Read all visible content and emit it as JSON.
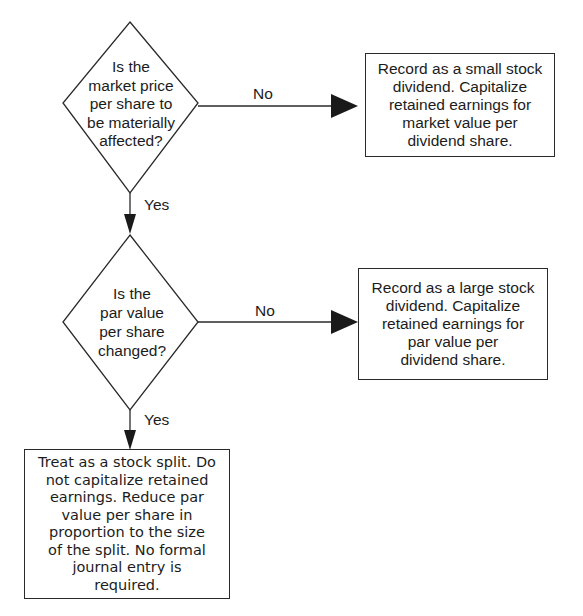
{
  "decisions": [
    {
      "id": "market-price",
      "lines": [
        "Is the",
        "market price",
        "per share to",
        "be materially",
        "affected?"
      ]
    },
    {
      "id": "par-value",
      "lines": [
        "Is the",
        "par value",
        "per share",
        "changed?"
      ]
    }
  ],
  "outcomes": [
    {
      "id": "small-stock-dividend",
      "lines": [
        "Record as a small stock",
        "dividend. Capitalize",
        "retained earnings for",
        "market value per",
        "dividend share."
      ]
    },
    {
      "id": "large-stock-dividend",
      "lines": [
        "Record as a large stock",
        "dividend. Capitalize",
        "retained earnings for",
        "par value per",
        "dividend share."
      ]
    },
    {
      "id": "stock-split",
      "lines": [
        "Treat as a stock split. Do",
        "not capitalize retained",
        "earnings. Reduce par",
        "value per share in",
        "proportion to the size",
        "of the split. No formal",
        "journal entry is",
        "required."
      ]
    }
  ],
  "edges": {
    "d1_no": "No",
    "d1_yes": "Yes",
    "d2_no": "No",
    "d2_yes": "Yes"
  }
}
